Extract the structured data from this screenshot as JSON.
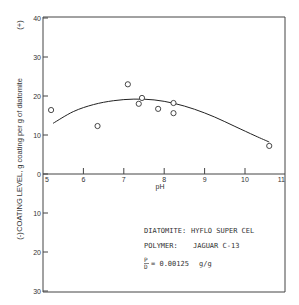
{
  "chart_data": {
    "type": "scatter",
    "title": "",
    "xlabel": "pH",
    "ylabel": "COATING LEVEL, g coating per g of diatomite",
    "ylabel_positive_marker": "(+)",
    "ylabel_negative_marker": "(-)",
    "xlim": [
      5,
      11
    ],
    "ylim": [
      -30,
      40
    ],
    "x_ticks": [
      "5",
      "6",
      "7",
      "8",
      "9",
      "10",
      "11"
    ],
    "y_ticks_upper": [
      "40",
      "30",
      "20",
      "10",
      "0"
    ],
    "y_ticks_lower": [
      "10",
      "20",
      "30"
    ],
    "grid": false,
    "series": [
      {
        "name": "measured",
        "marker": "open-circle",
        "points": [
          {
            "x": 5.2,
            "y": 16.4
          },
          {
            "x": 6.35,
            "y": 12.3
          },
          {
            "x": 7.1,
            "y": 23.0
          },
          {
            "x": 7.37,
            "y": 18.0
          },
          {
            "x": 7.45,
            "y": 19.5
          },
          {
            "x": 7.85,
            "y": 16.7
          },
          {
            "x": 8.23,
            "y": 18.2
          },
          {
            "x": 8.23,
            "y": 15.6
          },
          {
            "x": 10.6,
            "y": 7.2
          }
        ]
      },
      {
        "name": "fitted curve",
        "marker": "line",
        "points": [
          {
            "x": 5.25,
            "y": 13.0
          },
          {
            "x": 5.75,
            "y": 16.0
          },
          {
            "x": 6.25,
            "y": 17.8
          },
          {
            "x": 6.75,
            "y": 18.8
          },
          {
            "x": 7.25,
            "y": 19.2
          },
          {
            "x": 7.75,
            "y": 19.0
          },
          {
            "x": 8.25,
            "y": 18.1
          },
          {
            "x": 8.75,
            "y": 16.6
          },
          {
            "x": 9.25,
            "y": 14.6
          },
          {
            "x": 9.75,
            "y": 12.2
          },
          {
            "x": 10.25,
            "y": 9.8
          },
          {
            "x": 10.6,
            "y": 8.2
          }
        ]
      }
    ],
    "annotations": {
      "diatomite_label": "DIATOMITE:",
      "diatomite_value": "HYFLO SUPER CEL",
      "polymer_label": "POLYMER:",
      "polymer_value": "JAGUAR C-13",
      "ratio_numerator": "P",
      "ratio_denominator": "D",
      "ratio_value": "= 0.00125",
      "ratio_units": "g/g"
    }
  }
}
